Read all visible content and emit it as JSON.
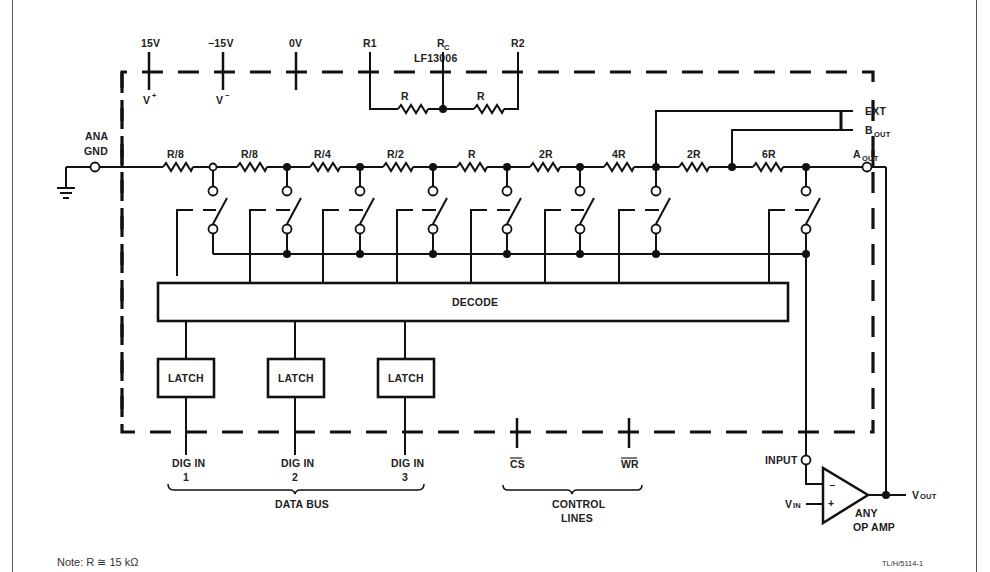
{
  "diagram": {
    "chip_label": "LF13006",
    "top_pins": [
      {
        "label": "15V",
        "sub": "V",
        "sup": "+"
      },
      {
        "label": "−15V",
        "sub": "V",
        "sup": "−"
      },
      {
        "label": "0V"
      },
      {
        "label": "R1"
      },
      {
        "label": "R",
        "label_sub": "C"
      },
      {
        "label": "R2"
      }
    ],
    "feedback_resistors": [
      "R",
      "R"
    ],
    "ana_gnd": [
      "ANA",
      "GND"
    ],
    "ladder_resistors": [
      "R/8",
      "R/8",
      "R/4",
      "R/2",
      "R",
      "2R",
      "4R",
      "2R",
      "6R"
    ],
    "right_pins": {
      "ext": "EXT",
      "bout": "B",
      "bout_sub": "OUT",
      "aout": "A",
      "aout_sub": "OUT"
    },
    "decode_label": "DECODE",
    "latches": [
      "LATCH",
      "LATCH",
      "LATCH"
    ],
    "dig_inputs": [
      {
        "line1": "DIG IN",
        "line2": "1"
      },
      {
        "line1": "DIG IN",
        "line2": "2"
      },
      {
        "line1": "DIG IN",
        "line2": "3"
      }
    ],
    "data_bus_label": "DATA BUS",
    "control_pins": [
      "CS",
      "WR"
    ],
    "control_label": [
      "CONTROL",
      "LINES"
    ],
    "opamp": {
      "input_label": "INPUT",
      "vin": "V",
      "vin_sub": "IN",
      "vout": "V",
      "vout_sub": "OUT",
      "minus": "−",
      "plus": "+",
      "caption": [
        "ANY",
        "OP AMP"
      ]
    },
    "note": "Note:  R ≅ 15 kΩ",
    "figure_ref": "TL/H/5114-1"
  }
}
